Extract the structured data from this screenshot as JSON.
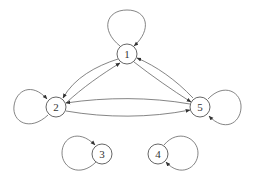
{
  "diagram": {
    "type": "directed-graph",
    "nodes": [
      {
        "id": "1",
        "label": "1",
        "x": 127,
        "y": 54
      },
      {
        "id": "2",
        "label": "2",
        "x": 56,
        "y": 107
      },
      {
        "id": "3",
        "label": "3",
        "x": 102,
        "y": 154
      },
      {
        "id": "4",
        "label": "4",
        "x": 158,
        "y": 154
      },
      {
        "id": "5",
        "label": "5",
        "x": 200,
        "y": 107
      }
    ],
    "edges": [
      {
        "from": "1",
        "to": "1",
        "kind": "self-loop"
      },
      {
        "from": "2",
        "to": "2",
        "kind": "self-loop"
      },
      {
        "from": "3",
        "to": "3",
        "kind": "self-loop"
      },
      {
        "from": "4",
        "to": "4",
        "kind": "self-loop"
      },
      {
        "from": "5",
        "to": "5",
        "kind": "self-loop"
      },
      {
        "from": "1",
        "to": "2"
      },
      {
        "from": "2",
        "to": "1"
      },
      {
        "from": "1",
        "to": "5"
      },
      {
        "from": "5",
        "to": "1"
      },
      {
        "from": "2",
        "to": "5"
      },
      {
        "from": "5",
        "to": "2"
      }
    ]
  }
}
